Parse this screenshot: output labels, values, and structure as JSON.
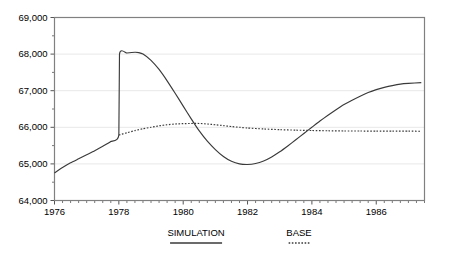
{
  "chart_data": {
    "type": "line",
    "title": "",
    "xlabel": "",
    "ylabel": "",
    "xlim": [
      1976,
      1987.5
    ],
    "ylim": [
      64000,
      69000
    ],
    "grid": true,
    "legend_position": "bottom",
    "y_ticks": [
      64000,
      65000,
      66000,
      67000,
      68000,
      69000
    ],
    "y_tick_labels": [
      "64,000",
      "65,000",
      "66,000",
      "67,000",
      "68,000",
      "69,000"
    ],
    "y_minor_step": 500,
    "x_ticks": [
      1976,
      1978,
      1980,
      1982,
      1984,
      1986
    ],
    "x_tick_labels": [
      "1976",
      "1978",
      "1980",
      "1982",
      "1984",
      "1986"
    ],
    "x_minor_step": 0.25,
    "series": [
      {
        "name": "SIMULATION",
        "style": "solid",
        "x": [
          1976.0,
          1976.25,
          1976.5,
          1976.75,
          1977.0,
          1977.25,
          1977.5,
          1977.75,
          1978.0,
          1978.02,
          1978.25,
          1978.5,
          1978.62,
          1978.75,
          1979.0,
          1979.25,
          1979.5,
          1979.75,
          1980.0,
          1980.25,
          1980.5,
          1980.75,
          1981.0,
          1981.25,
          1981.5,
          1981.75,
          1982.0,
          1982.25,
          1982.5,
          1982.75,
          1983.0,
          1983.25,
          1983.5,
          1983.75,
          1984.0,
          1984.25,
          1984.5,
          1984.75,
          1985.0,
          1985.25,
          1985.5,
          1985.75,
          1986.0,
          1986.25,
          1986.5,
          1986.75,
          1987.0,
          1987.4
        ],
        "y": [
          64750,
          64900,
          65030,
          65140,
          65250,
          65360,
          65480,
          65610,
          65790,
          68000,
          68030,
          68050,
          68040,
          68000,
          67830,
          67580,
          67270,
          66930,
          66580,
          66230,
          65900,
          65620,
          65390,
          65200,
          65070,
          65000,
          64985,
          65010,
          65080,
          65190,
          65330,
          65490,
          65660,
          65830,
          66000,
          66170,
          66330,
          66480,
          66620,
          66740,
          66850,
          66950,
          67030,
          67090,
          67140,
          67180,
          67200,
          67220
        ]
      },
      {
        "name": "BASE",
        "style": "dotted",
        "x": [
          1978.0,
          1978.25,
          1978.5,
          1978.75,
          1979.0,
          1979.25,
          1979.5,
          1979.75,
          1980.0,
          1980.25,
          1980.5,
          1980.75,
          1981.0,
          1981.25,
          1981.5,
          1981.75,
          1982.0,
          1982.5,
          1983.0,
          1983.5,
          1984.0,
          1984.5,
          1985.0,
          1985.5,
          1986.0,
          1986.5,
          1987.0,
          1987.4
        ],
        "y": [
          65790,
          65850,
          65910,
          65960,
          66000,
          66040,
          66070,
          66090,
          66100,
          66105,
          66105,
          66090,
          66070,
          66045,
          66020,
          66000,
          65980,
          65955,
          65935,
          65922,
          65912,
          65905,
          65900,
          65898,
          65896,
          65895,
          65894,
          65893
        ]
      }
    ],
    "annotations": []
  },
  "legend": {
    "items": [
      {
        "label": "SIMULATION",
        "style": "solid"
      },
      {
        "label": "BASE",
        "style": "dotted"
      }
    ]
  }
}
